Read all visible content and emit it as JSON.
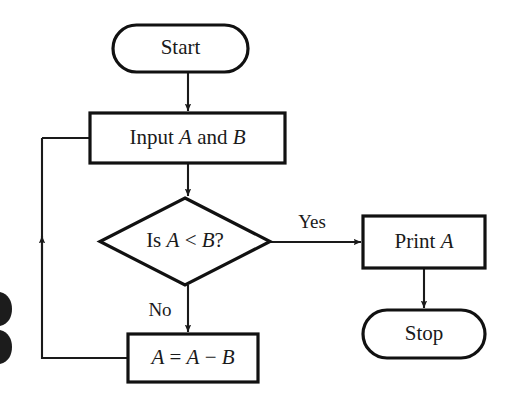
{
  "diagram": {
    "type": "flowchart",
    "background_color": "#ffffff",
    "line_color": "#1a1a1a",
    "shape_fill": "#ffffff",
    "nodes": [
      {
        "id": "start",
        "shape": "stadium",
        "label": "Start",
        "x": 113,
        "y": 25,
        "width": 135,
        "height": 47
      },
      {
        "id": "input",
        "shape": "rectangle",
        "label_prefix": "Input ",
        "label_var1": "A",
        "label_middle": " and ",
        "label_var2": "B",
        "label_full": "Input A and B",
        "x": 90,
        "y": 113,
        "width": 195,
        "height": 50
      },
      {
        "id": "decision",
        "shape": "diamond",
        "label_prefix": "Is ",
        "label_var1": "A",
        "label_operator": " < ",
        "label_var2": "B",
        "label_suffix": "?",
        "label_full": "Is A < B?",
        "x": 100,
        "y": 198,
        "width": 170,
        "height": 87
      },
      {
        "id": "print",
        "shape": "rectangle",
        "label_prefix": "Print ",
        "label_var1": "A",
        "label_full": "Print A",
        "x": 363,
        "y": 216,
        "width": 122,
        "height": 52
      },
      {
        "id": "assign",
        "shape": "rectangle",
        "label_var1": "A",
        "label_equals": " = ",
        "label_var2": "A",
        "label_minus": " − ",
        "label_var3": "B",
        "label_full": "A = A − B",
        "x": 128,
        "y": 334,
        "width": 130,
        "height": 48
      },
      {
        "id": "stop",
        "shape": "stadium",
        "label": "Stop",
        "x": 363,
        "y": 310,
        "width": 122,
        "height": 48
      }
    ],
    "edges": [
      {
        "id": "start-to-input",
        "from": "start",
        "to": "input",
        "label": "",
        "arrow": true
      },
      {
        "id": "input-to-decision",
        "from": "input",
        "to": "decision",
        "label": "",
        "arrow": true
      },
      {
        "id": "decision-to-print",
        "from": "decision",
        "to": "print",
        "label": "Yes",
        "arrow": true
      },
      {
        "id": "decision-to-assign",
        "from": "decision",
        "to": "assign",
        "label": "No",
        "arrow": true
      },
      {
        "id": "print-to-stop",
        "from": "print",
        "to": "stop",
        "label": "",
        "arrow": true
      },
      {
        "id": "assign-to-input-loop",
        "from": "assign",
        "to": "input",
        "label": "",
        "arrow": true
      }
    ],
    "edge_labels": {
      "yes": "Yes",
      "no": "No"
    }
  }
}
